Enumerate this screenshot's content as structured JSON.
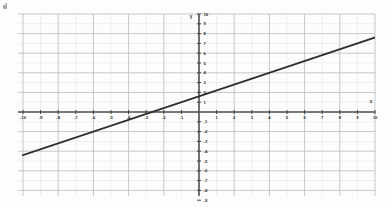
{
  "figure": {
    "title": "",
    "background_color": "#fdfdfd",
    "grid_color": "#b9bcc4",
    "minor_grid_color": "#d9dbe0",
    "axis_color": "#4a4a4a",
    "line_color": "#2b2b2b",
    "label_color": "#2b2b2b"
  },
  "axis_labels": {
    "x": "x",
    "y": "y"
  },
  "chart_data": {
    "type": "line",
    "title": "",
    "xlabel": "x",
    "ylabel": "y",
    "xlim": [
      -10,
      10
    ],
    "ylim": [
      -10,
      10
    ],
    "grid": true,
    "legend": "none",
    "x_ticks": [
      -10,
      -9,
      -8,
      -7,
      -6,
      -5,
      -4,
      -3,
      -2,
      -1,
      1,
      2,
      3,
      4,
      5,
      6,
      7,
      8,
      9,
      10
    ],
    "y_ticks": [
      -10,
      -9,
      -8,
      -7,
      -6,
      -5,
      -4,
      -3,
      -2,
      -1,
      1,
      2,
      3,
      4,
      5,
      6,
      7,
      8,
      9,
      10
    ],
    "x_tick_labels": [
      "-10",
      "-9",
      "-8",
      "-7",
      "-6",
      "-5",
      "-4",
      "-3",
      "-2",
      "-1",
      "1",
      "2",
      "3",
      "4",
      "5",
      "6",
      "7",
      "8",
      "9",
      "10"
    ],
    "y_tick_labels": [
      "-10",
      "-9",
      "-8",
      "-7",
      "-6",
      "-5",
      "-4",
      "-3",
      "-2",
      "-1",
      "1",
      "2",
      "3",
      "4",
      "5",
      "6",
      "7",
      "8",
      "9",
      "10"
    ],
    "major_gridline_step": 2,
    "minor_gridline_step": 1,
    "series": [
      {
        "name": "line",
        "type": "line",
        "slope": 0.6,
        "intercept": 1.6,
        "x": [
          -10,
          10
        ],
        "values": [
          -4.4,
          7.6
        ],
        "x_intercept": -2.6,
        "y_intercept": 1.6
      }
    ]
  }
}
